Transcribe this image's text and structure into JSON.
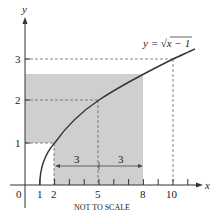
{
  "figure": {
    "function_label": "y = √x − 1",
    "function_label_parts": {
      "lhs": "y = ",
      "radical": "√",
      "radicand": "x − 1"
    },
    "caption": "NOT TO SCALE",
    "axis_x_label": "x",
    "axis_y_label": "y",
    "origin_label": "0",
    "x_ticks": [
      {
        "value": 1,
        "label": "1"
      },
      {
        "value": 2,
        "label": "2"
      },
      {
        "value": 5,
        "label": "5"
      },
      {
        "value": 8,
        "label": "8"
      },
      {
        "value": 10,
        "label": "10"
      }
    ],
    "y_ticks": [
      {
        "value": 1,
        "label": "1"
      },
      {
        "value": 2,
        "label": "2"
      },
      {
        "value": 3,
        "label": "3"
      }
    ],
    "interval_labels": [
      "3",
      "3"
    ],
    "shaded_region": {
      "x_from": 0,
      "x_to": 8,
      "y_top": 2.65,
      "cutout": {
        "x_from": 0,
        "x_to": 2,
        "y_to": 1
      }
    },
    "colors": {
      "shade": "#cfcfcf",
      "curve": "#333333",
      "axes": "#333333",
      "dashed": "#555555"
    }
  }
}
